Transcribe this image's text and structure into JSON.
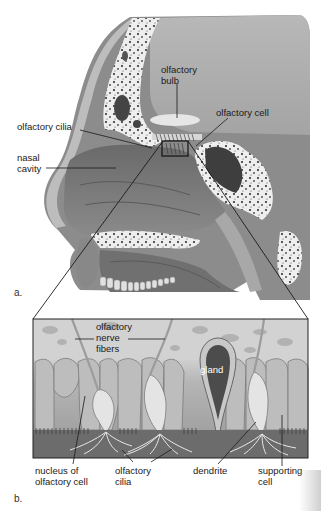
{
  "figure": {
    "panel_a": {
      "letter": "a.",
      "labels": {
        "olfactory_bulb": [
          "olfactory",
          "bulb"
        ],
        "olfactory_cell": "olfactory cell",
        "olfactory_cilia": "olfactory cilia",
        "nasal_cavity": [
          "nasal",
          "cavity"
        ]
      }
    },
    "panel_b": {
      "letter": "b.",
      "labels": {
        "olfactory_nerve_fibers": [
          "olfactory",
          "nerve",
          "fibers"
        ],
        "gland": "gland",
        "nucleus_of_olfactory_cell": [
          "nucleus of",
          "olfactory cell"
        ],
        "olfactory_cilia": [
          "olfactory",
          "cilia"
        ],
        "dendrite": "dendrite",
        "supporting_cell": [
          "supporting",
          "cell"
        ]
      }
    },
    "colors": {
      "tissue_dark": "#6f6f6f",
      "tissue_mid": "#9a9a9a",
      "tissue_light": "#c9c9c9",
      "bone": "#ececec",
      "leader_line": "#1a1a1a"
    }
  }
}
